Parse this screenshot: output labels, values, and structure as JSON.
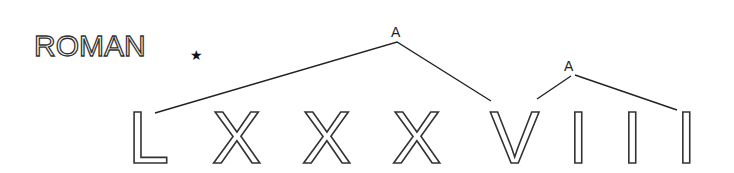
{
  "title": {
    "text": "ROMAN",
    "marker": "★"
  },
  "tree": {
    "root_label": "A",
    "sub_label": "A"
  },
  "numeral": {
    "letters": [
      "L",
      "X",
      "X",
      "X",
      "V",
      "I",
      "I",
      "I"
    ]
  },
  "colors": {
    "stroke": "#333333",
    "background": "#ffffff"
  }
}
